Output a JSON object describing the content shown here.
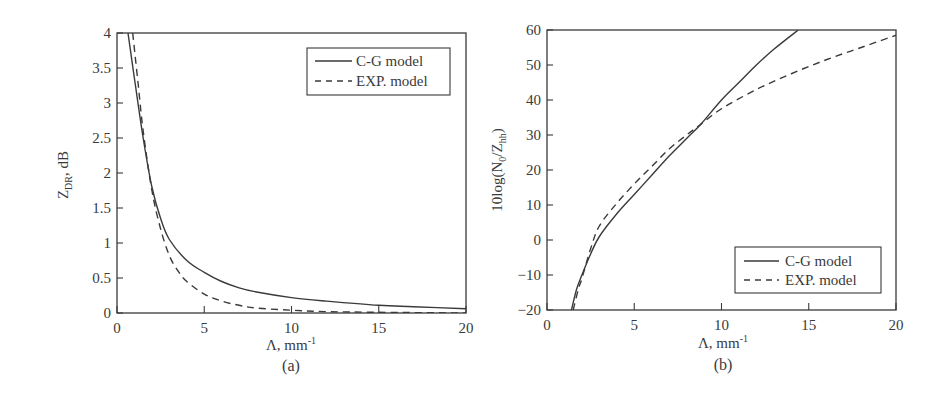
{
  "chart_data": [
    {
      "id": "a",
      "type": "line",
      "caption": "(a)",
      "title": "",
      "xlabel": "Λ, mm",
      "xlabel_sup": "-1",
      "ylabel_main": "Z",
      "ylabel_sub": "DR",
      "ylabel_tail": ", dB",
      "xlim": [
        0,
        20
      ],
      "ylim": [
        0,
        4
      ],
      "xticks": [
        0,
        5,
        10,
        15,
        20
      ],
      "yticks": [
        0,
        0.5,
        1,
        1.5,
        2,
        2.5,
        3,
        3.5,
        4
      ],
      "ytick_labels": [
        "0",
        "0.5",
        "1",
        "1.5",
        "2",
        "2.5",
        "3",
        "3.5",
        "4"
      ],
      "grid": false,
      "legend_position": "top-right",
      "series": [
        {
          "name": "C-G model",
          "style": "solid",
          "x": [
            0.63,
            1.0,
            1.5,
            2.0,
            2.5,
            3.0,
            4.0,
            5.0,
            6.0,
            7.0,
            8.0,
            10.0,
            12.0,
            15.0,
            17.0,
            20.0
          ],
          "y": [
            4.0,
            3.35,
            2.5,
            1.8,
            1.35,
            1.05,
            0.75,
            0.58,
            0.45,
            0.36,
            0.3,
            0.22,
            0.17,
            0.11,
            0.09,
            0.06
          ]
        },
        {
          "name": "EXP. model",
          "style": "dashed",
          "x": [
            0.9,
            1.2,
            1.5,
            2.0,
            2.5,
            3.0,
            3.5,
            4.0,
            5.0,
            6.0,
            7.0,
            8.0,
            10.0,
            12.0,
            15.0,
            20.0
          ],
          "y": [
            4.0,
            3.3,
            2.6,
            1.75,
            1.2,
            0.82,
            0.6,
            0.45,
            0.27,
            0.17,
            0.11,
            0.07,
            0.04,
            0.02,
            0.01,
            0.0
          ]
        }
      ]
    },
    {
      "id": "b",
      "type": "line",
      "caption": "(b)",
      "title": "",
      "xlabel": "Λ, mm",
      "xlabel_sup": "-1",
      "ylabel_main": "10log(N",
      "ylabel_sub0": "0",
      "ylabel_mid": "/Z",
      "ylabel_sub": "hh",
      "ylabel_tail": ")",
      "xlim": [
        0,
        20
      ],
      "ylim": [
        -20,
        60
      ],
      "xticks": [
        0,
        5,
        10,
        15,
        20
      ],
      "yticks": [
        -20,
        -10,
        0,
        10,
        20,
        30,
        40,
        50,
        60
      ],
      "ytick_labels": [
        "−20",
        "−10",
        "0",
        "10",
        "20",
        "30",
        "40",
        "50",
        "60"
      ],
      "grid": false,
      "legend_position": "bottom-right",
      "series": [
        {
          "name": "C-G model",
          "style": "solid",
          "x": [
            1.4,
            1.7,
            2.0,
            2.5,
            3.0,
            4.0,
            5.0,
            6.0,
            7.0,
            8.0,
            8.8,
            10.0,
            11.0,
            12.0,
            13.0,
            14.4
          ],
          "y": [
            -20,
            -14,
            -10,
            -4,
            1,
            7.5,
            13,
            18.5,
            24,
            29,
            33,
            40,
            45,
            50,
            54.5,
            60
          ]
        },
        {
          "name": "EXP. model",
          "style": "dashed",
          "x": [
            1.5,
            1.8,
            2.0,
            2.5,
            3.0,
            4.0,
            5.0,
            6.0,
            7.0,
            8.0,
            8.8,
            10.0,
            12.0,
            14.0,
            16.0,
            18.0,
            20.0
          ],
          "y": [
            -20,
            -14,
            -11,
            -2.5,
            4,
            10.5,
            16,
            21,
            26,
            30,
            33,
            37.5,
            43,
            47.5,
            51.5,
            55,
            58.5
          ]
        }
      ]
    }
  ]
}
